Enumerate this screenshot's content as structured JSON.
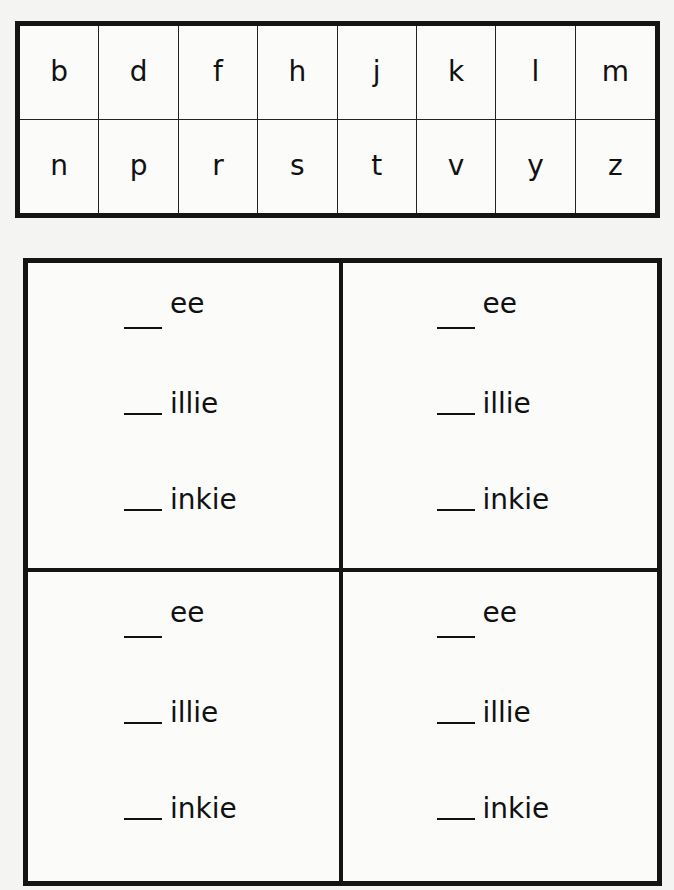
{
  "letter_table": {
    "rows": [
      [
        "b",
        "d",
        "f",
        "h",
        "j",
        "k",
        "l",
        "m"
      ],
      [
        "n",
        "p",
        "r",
        "s",
        "t",
        "v",
        "y",
        "z"
      ]
    ]
  },
  "word_boxes": [
    {
      "items": [
        {
          "blank": "__",
          "suffix": "ee"
        },
        {
          "blank": "__",
          "suffix": "illie"
        },
        {
          "blank": "__",
          "suffix": "inkie"
        }
      ]
    },
    {
      "items": [
        {
          "blank": "__",
          "suffix": "ee"
        },
        {
          "blank": "__",
          "suffix": "illie"
        },
        {
          "blank": "__",
          "suffix": "inkie"
        }
      ]
    },
    {
      "items": [
        {
          "blank": "__",
          "suffix": "ee"
        },
        {
          "blank": "__",
          "suffix": "illie"
        },
        {
          "blank": "__",
          "suffix": "inkie"
        }
      ]
    },
    {
      "items": [
        {
          "blank": "__",
          "suffix": "ee"
        },
        {
          "blank": "__",
          "suffix": "illie"
        },
        {
          "blank": "__",
          "suffix": "inkie"
        }
      ]
    }
  ]
}
